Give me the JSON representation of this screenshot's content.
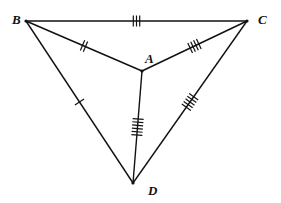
{
  "diagram": {
    "type": "geometry-figure",
    "points": {
      "B": {
        "label": "B",
        "x": 26,
        "y": 21
      },
      "C": {
        "label": "C",
        "x": 247,
        "y": 21
      },
      "A": {
        "label": "A",
        "x": 142,
        "y": 71
      },
      "D": {
        "label": "D",
        "x": 133,
        "y": 183
      }
    },
    "segments": [
      {
        "from": "B",
        "to": "C",
        "ticks": 3
      },
      {
        "from": "B",
        "to": "A",
        "ticks": 2
      },
      {
        "from": "A",
        "to": "C",
        "ticks": 4
      },
      {
        "from": "B",
        "to": "D",
        "ticks": 1
      },
      {
        "from": "A",
        "to": "D",
        "ticks": 6
      },
      {
        "from": "C",
        "to": "D",
        "ticks": 5
      }
    ],
    "line_color": "#111111"
  }
}
